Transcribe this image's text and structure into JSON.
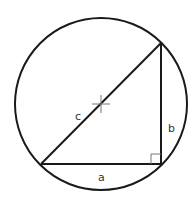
{
  "diagram": {
    "colors": {
      "stroke": "#1a1a1a",
      "center_mark": "#777777",
      "label": "#333333",
      "background": "#ffffff"
    },
    "circle": {
      "cx": 101,
      "cy": 104,
      "r": 86
    },
    "triangle": {
      "vertices": {
        "bottom_left": [
          41,
          164
        ],
        "bottom_right": [
          161,
          164
        ],
        "top": [
          161,
          43
        ]
      },
      "right_angle_at": "bottom_right"
    },
    "labels": {
      "hypotenuse": "c",
      "vertical_leg": "b",
      "horizontal_leg": "a"
    }
  }
}
